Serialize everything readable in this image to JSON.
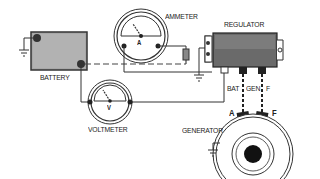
{
  "diagram": {
    "components": {
      "battery": {
        "label": "BATTERY"
      },
      "ammeter": {
        "label": "AMMETER",
        "dial_letter": "A"
      },
      "voltmeter": {
        "label": "VOLTMETER",
        "dial_letter": "V"
      },
      "regulator": {
        "label": "REGULATOR",
        "terminals": [
          "BAT",
          "GEN",
          "F"
        ]
      },
      "generator": {
        "label": "GENERATOR",
        "terminals": [
          "A",
          "F"
        ]
      }
    },
    "colors": {
      "line": "#222222",
      "battery_fill": "#9a9a9a",
      "regulator_fill": "#6a6a6a"
    }
  }
}
